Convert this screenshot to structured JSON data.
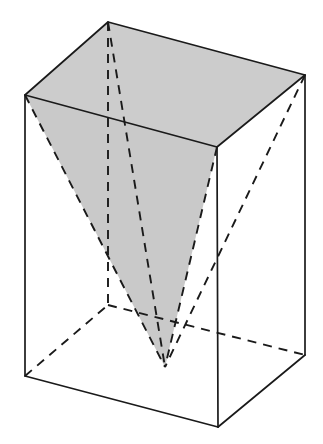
{
  "figure": {
    "description": "A wireframe rectangular prism drawn in oblique/isometric projection. Inside it an inverted square pyramid shares the prism's top face as its base and has its apex near the bottom face. The pyramid's base (the prism top face) and one visible lateral face are shaded light gray. Hidden edges are dashed.",
    "canvas": {
      "width": 323,
      "height": 444,
      "background": "#ffffff"
    },
    "style": {
      "stroke_color": "#1a1a1a",
      "stroke_width": 1.6,
      "hidden_stroke_width": 1.9,
      "shade_fill_top": "#cccccc",
      "shade_fill_face": "#c9c9c9",
      "dash_pattern": "9 7"
    },
    "labels": [],
    "vertices": {
      "top_left": {
        "name": "top-left-vertex",
        "x": 25,
        "y": 95
      },
      "top_back": {
        "name": "top-back-vertex",
        "x": 108,
        "y": 22
      },
      "top_right": {
        "name": "top-right-vertex",
        "x": 305,
        "y": 75
      },
      "top_front": {
        "name": "top-front-vertex",
        "x": 217,
        "y": 147
      },
      "bottom_left": {
        "name": "bottom-left-vertex",
        "x": 25,
        "y": 376
      },
      "bottom_back": {
        "name": "bottom-back-vertex",
        "x": 108,
        "y": 305
      },
      "bottom_right": {
        "name": "bottom-right-vertex",
        "x": 305,
        "y": 355
      },
      "bottom_front": {
        "name": "bottom-front-vertex",
        "x": 218,
        "y": 427
      },
      "pyramid_apex": {
        "name": "pyramid-apex-vertex",
        "x": 165,
        "y": 367
      }
    },
    "paths": {
      "top_face": "M25,95 L108,22 L305,75 L217,147 Z",
      "pyramid_left_face": "M25,95 L217,147 L165,367 Z",
      "prism_front_left_face": "M25,95 L217,147 L218,427 L25,376 Z",
      "prism_front_right_face": "M217,147 L305,75 L305,355 L218,427 Z",
      "edge_left_vertical": "M25,95 L25,376",
      "edge_front_vertical": "M217,147 L218,427",
      "edge_right_vertical": "M305,75 L305,355",
      "edge_back_vertical_hidden": "M108,22 L108,305",
      "edge_bottom_left_front": "M25,376 L218,427",
      "edge_bottom_front_right": "M218,427 L305,355",
      "edge_bottom_left_back_hidden": "M25,376 L108,305",
      "edge_bottom_back_right_hidden": "M108,305 L305,355",
      "edge_top_left_back": "M25,95 L108,22",
      "edge_top_back_right": "M108,22 L305,75",
      "edge_top_right_front": "M305,75 L217,147",
      "edge_top_front_left": "M217,147 L25,95",
      "pyramid_edge_left": "M25,95 L165,367",
      "pyramid_edge_front": "M217,147 L165,367",
      "pyramid_edge_right": "M305,75 L165,367",
      "pyramid_edge_back_hidden": "M108,22 L165,367"
    }
  }
}
